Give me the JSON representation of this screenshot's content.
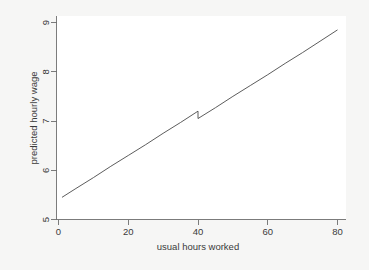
{
  "figure": {
    "background_color": "#f6f6f5",
    "plot_background_color": "#ffffff",
    "line_color": "#4a4a4a",
    "axis_color": "#6e6e6e",
    "text_color": "#3a3a3a"
  },
  "chart_data": {
    "type": "line",
    "title": "",
    "subtitle": "",
    "xlabel": "usual hours worked",
    "ylabel": "predicted hourly wage",
    "xlim": [
      0,
      80
    ],
    "ylim": [
      5,
      9
    ],
    "xticks": [
      0,
      20,
      40,
      60,
      80
    ],
    "xtick_labels": [
      "0",
      "20",
      "40",
      "60",
      "80"
    ],
    "yticks": [
      5,
      6,
      7,
      8,
      9
    ],
    "ytick_labels": [
      "5",
      "6",
      "7",
      "8",
      "9"
    ],
    "grid": false,
    "legend": false,
    "legend_position": "none",
    "annotations": [
      {
        "text": "downward discontinuity in fitted line at 40 usual hours worked",
        "x": 40,
        "y": 7.2
      }
    ],
    "series": [
      {
        "name": "predicted hourly wage",
        "color": "#4a4a4a",
        "x": [
          1,
          5,
          10,
          15,
          20,
          25,
          30,
          35,
          40,
          40,
          45,
          50,
          55,
          60,
          65,
          70,
          75,
          80
        ],
        "values": [
          5.45,
          5.63,
          5.85,
          6.08,
          6.3,
          6.52,
          6.75,
          6.97,
          7.2,
          7.05,
          7.27,
          7.5,
          7.72,
          7.94,
          8.17,
          8.39,
          8.62,
          8.85
        ]
      }
    ]
  },
  "axes": {
    "x_axis_name": "usual hours worked",
    "y_axis_name": "predicted hourly wage"
  }
}
